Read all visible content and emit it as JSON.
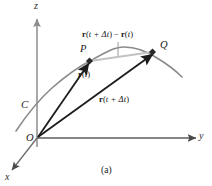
{
  "figure": {
    "caption": "(a)",
    "axes": [
      {
        "id": "z-axis",
        "label": "z"
      },
      {
        "id": "y-axis",
        "label": "y"
      },
      {
        "id": "x-axis",
        "label": "x"
      }
    ],
    "points": [
      {
        "id": "point-p",
        "label": "P"
      },
      {
        "id": "point-q",
        "label": "Q"
      },
      {
        "id": "origin",
        "label": "O"
      }
    ],
    "curve": {
      "id": "curve-c",
      "label": "C"
    },
    "vectors": [
      {
        "id": "position-vector-t",
        "bold_symbol": "r",
        "arg_open": "(",
        "arg": "t",
        "arg_close": ")",
        "full_label": "r(t)"
      },
      {
        "id": "position-vector-t-plus-dt",
        "bold_symbol": "r",
        "arg_open": "(",
        "arg": "t + Δt",
        "arg_close": ")",
        "full_label": "r(t + Δt)"
      },
      {
        "id": "secant-difference-vector",
        "bold_symbol_1": "r",
        "arg_1": "t + Δt",
        "operator": "−",
        "bold_symbol_2": "r",
        "arg_2": "t",
        "full_label": "r(t + Δt) − r(t)"
      }
    ],
    "colors": {
      "background": "#ffffff",
      "axis": "#8c8c8c",
      "curve": "#8a8a8a",
      "vector": "#1c1c1c",
      "secant": "#bdbdbd",
      "label": "#1a1a1a"
    }
  }
}
